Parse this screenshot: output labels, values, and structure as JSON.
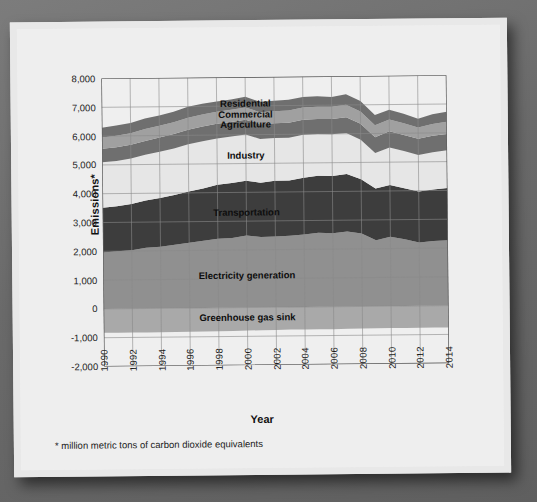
{
  "figure": {
    "ylabel": "Emissions*",
    "xlabel": "Year",
    "footnote": "* million metric tons of carbon dioxide equivalents"
  },
  "colors": {
    "background_outer": "#6e6e6e",
    "card": "#ececec",
    "plot_background": "#efefef",
    "grid": "#8a8a8a",
    "axis": "#555555",
    "greenhouse_gas_sink": "#a9a9a9",
    "electricity_generation": "#909090",
    "transportation": "#3d3d3d",
    "industry": "#e6e6e6",
    "agriculture": "#6f6f6f",
    "commercial": "#a0a0a0",
    "residential": "#6f6f6f",
    "text": "#111111"
  },
  "series_labels": [
    {
      "name": "Residential",
      "x": 2000,
      "y": 7080
    },
    {
      "name": "Commercial",
      "x": 2000,
      "y": 6730
    },
    {
      "name": "Agriculture",
      "x": 2000,
      "y": 6360
    },
    {
      "name": "Industry",
      "x": 2000,
      "y": 5300
    },
    {
      "name": "Transportation",
      "x": 2000,
      "y": 3320
    },
    {
      "name": "Electricity generation",
      "x": 2000,
      "y": 1120
    },
    {
      "name": "Greenhouse gas sink",
      "x": 2000,
      "y": -330
    }
  ],
  "chart_data": {
    "type": "area",
    "title": "",
    "xlabel": "Year",
    "ylabel": "Emissions*",
    "footnote": "* million metric tons of carbon dioxide equivalents",
    "stacked": true,
    "grid": true,
    "legend": "inline-labels",
    "xlim": [
      1990,
      2014
    ],
    "ylim": [
      -2000,
      8000
    ],
    "ytick_labels": [
      "8,000",
      "7,000",
      "6,000",
      "5,000",
      "4,000",
      "3,000",
      "2,000",
      "1,000",
      "0",
      "-1,000",
      "-2,000"
    ],
    "yticks": [
      8000,
      7000,
      6000,
      5000,
      4000,
      3000,
      2000,
      1000,
      0,
      -1000,
      -2000
    ],
    "xtick_labels": [
      "1990",
      "1992",
      "1994",
      "1996",
      "1998",
      "2000",
      "2002",
      "2004",
      "2006",
      "2008",
      "2010",
      "2012",
      "2014"
    ],
    "xticks": [
      1990,
      1992,
      1994,
      1996,
      1998,
      2000,
      2002,
      2004,
      2006,
      2008,
      2010,
      2012,
      2014
    ],
    "x": [
      1990,
      1991,
      1992,
      1993,
      1994,
      1995,
      1996,
      1997,
      1998,
      1999,
      2000,
      2001,
      2002,
      2003,
      2004,
      2005,
      2006,
      2007,
      2008,
      2009,
      2010,
      2011,
      2012,
      2013,
      2014
    ],
    "series": [
      {
        "name": "Greenhouse gas sink",
        "color": "#a9a9a9",
        "values": [
          -830,
          -830,
          -830,
          -830,
          -830,
          -830,
          -820,
          -820,
          -810,
          -810,
          -800,
          -790,
          -790,
          -780,
          -780,
          -780,
          -780,
          -770,
          -770,
          -760,
          -760,
          -760,
          -760,
          -760,
          -760
        ]
      },
      {
        "name": "Electricity generation",
        "color": "#909090",
        "values": [
          1960,
          2000,
          2030,
          2110,
          2140,
          2200,
          2270,
          2330,
          2400,
          2420,
          2500,
          2440,
          2460,
          2480,
          2520,
          2570,
          2550,
          2610,
          2530,
          2290,
          2410,
          2320,
          2200,
          2250,
          2270
        ]
      },
      {
        "name": "Transportation",
        "color": "#3d3d3d",
        "values": [
          1550,
          1560,
          1600,
          1640,
          1690,
          1730,
          1780,
          1820,
          1870,
          1910,
          1900,
          1890,
          1930,
          1920,
          1970,
          1980,
          1990,
          1990,
          1890,
          1800,
          1800,
          1770,
          1770,
          1790,
          1810
        ]
      },
      {
        "name": "Industry",
        "color": "#e6e6e6",
        "values": [
          1580,
          1570,
          1580,
          1590,
          1610,
          1620,
          1640,
          1640,
          1610,
          1610,
          1610,
          1520,
          1490,
          1480,
          1490,
          1450,
          1450,
          1430,
          1370,
          1230,
          1300,
          1290,
          1270,
          1290,
          1310
        ]
      },
      {
        "name": "Agriculture",
        "color": "#6f6f6f",
        "values": [
          470,
          480,
          480,
          480,
          490,
          500,
          500,
          510,
          510,
          510,
          510,
          510,
          510,
          520,
          520,
          520,
          530,
          540,
          550,
          550,
          560,
          560,
          560,
          570,
          570
        ]
      },
      {
        "name": "Commercial",
        "color": "#a0a0a0",
        "values": [
          390,
          400,
          400,
          410,
          410,
          410,
          420,
          420,
          420,
          420,
          430,
          420,
          420,
          430,
          430,
          430,
          420,
          440,
          430,
          420,
          410,
          410,
          390,
          410,
          420
        ]
      },
      {
        "name": "Residential",
        "color": "#6f6f6f",
        "values": [
          340,
          350,
          360,
          370,
          360,
          360,
          380,
          370,
          350,
          360,
          370,
          360,
          360,
          370,
          360,
          360,
          340,
          360,
          360,
          350,
          340,
          330,
          310,
          340,
          350
        ]
      }
    ]
  }
}
